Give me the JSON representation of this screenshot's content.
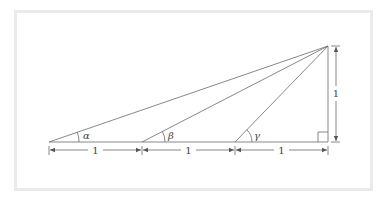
{
  "diagram": {
    "title": "",
    "colors": {
      "frame": "#ebebeb",
      "line": "#6a6a6a",
      "text": "#444444",
      "background": "#ffffff"
    },
    "angles": {
      "alpha": "α",
      "beta": "β",
      "gamma": "γ"
    },
    "dimensions": {
      "seg1": "1",
      "seg2": "1",
      "seg3": "1",
      "height": "1"
    },
    "right_angle_marker": true
  }
}
